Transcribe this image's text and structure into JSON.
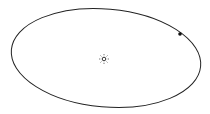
{
  "diagram": {
    "type": "orbit",
    "orbit": {
      "cx": 106,
      "cy": 58,
      "rx": 95,
      "ry": 49,
      "rotation": 5,
      "stroke": "#222222"
    },
    "sun": {
      "cx": 104,
      "cy": 59,
      "r": 2,
      "ray_radius": 5,
      "color": "#333333"
    },
    "planet": {
      "cx": 180,
      "cy": 34,
      "r": 1.8,
      "color": "#111111"
    }
  }
}
